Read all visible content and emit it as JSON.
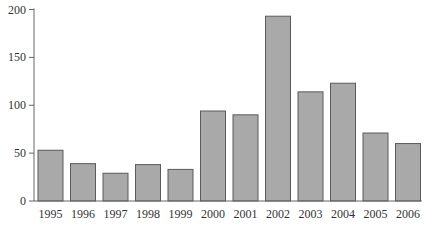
{
  "chart_data": {
    "type": "bar",
    "title": "",
    "xlabel": "",
    "ylabel": "",
    "categories": [
      "1995",
      "1996",
      "1997",
      "1998",
      "1999",
      "2000",
      "2001",
      "2002",
      "2003",
      "2004",
      "2005",
      "2006"
    ],
    "values": [
      53,
      39,
      29,
      38,
      33,
      94,
      90,
      193,
      114,
      123,
      71,
      60
    ],
    "ylim": [
      0,
      200
    ],
    "yticks": [
      0,
      50,
      100,
      150,
      200
    ],
    "grid": false,
    "legend": null,
    "colors": {
      "bar_fill": "#a9a9a9",
      "bar_stroke": "#5a5a5a",
      "axis": "#666666",
      "text": "#333333"
    }
  }
}
